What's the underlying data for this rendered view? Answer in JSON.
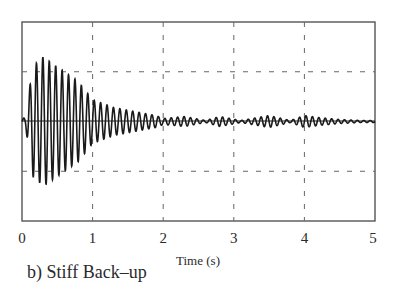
{
  "chart_data": {
    "type": "line",
    "title": "",
    "caption": "b) Stiff Back–up",
    "xlabel": "Time (s)",
    "ylabel": "",
    "xlim": [
      0,
      5
    ],
    "ylim": [
      -1,
      1
    ],
    "x_ticks": [
      "0",
      "1",
      "2",
      "3",
      "4",
      "5"
    ],
    "y_ticks": [],
    "grid": {
      "vertical": [
        1,
        2,
        3,
        4
      ],
      "horizontal": [
        0.5,
        -0.5
      ],
      "style": "dashed"
    },
    "legend": null,
    "series": [
      {
        "name": "response",
        "description": "Decaying oscillation; peak amplitude ~0.65 at t≈0.3s, decays to ~0.2 by t=1s, ~0.03 by t=2s; small beating bursts near t≈2.3, 3.5, 4.2",
        "envelope": {
          "t": [
            0.0,
            0.05,
            0.15,
            0.3,
            0.5,
            0.8,
            1.0,
            1.3,
            1.6,
            1.9,
            2.0,
            2.3,
            2.6,
            2.8,
            3.1,
            3.5,
            3.8,
            4.0,
            4.2,
            4.5,
            4.8,
            5.0
          ],
          "amplitude": [
            0.02,
            0.05,
            0.55,
            0.65,
            0.55,
            0.4,
            0.22,
            0.14,
            0.1,
            0.06,
            0.03,
            0.05,
            0.01,
            0.05,
            0.01,
            0.06,
            0.01,
            0.06,
            0.04,
            0.02,
            0.01,
            0.01
          ]
        },
        "frequency_hz": 11,
        "color": "#1a1a1a"
      }
    ]
  },
  "axis": {
    "tick_labels": [
      "0",
      "1",
      "2",
      "3",
      "4",
      "5"
    ],
    "xlabel": "Time (s)"
  },
  "caption": "b) Stiff Back–up",
  "colors": {
    "line": "#1a1a1a",
    "frame": "#555555",
    "grid": "#666666"
  }
}
